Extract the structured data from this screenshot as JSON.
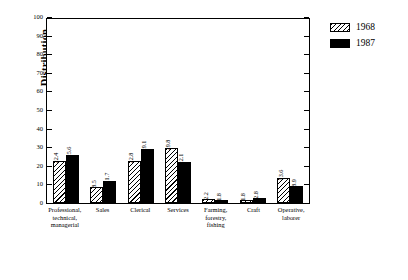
{
  "chart_data": {
    "type": "bar",
    "title": "",
    "xlabel": "",
    "ylabel": "Distribution",
    "ylim": [
      0,
      100
    ],
    "yticks": [
      0,
      10,
      20,
      30,
      40,
      50,
      60,
      70,
      80,
      90,
      100
    ],
    "grid": false,
    "legend_position": "right",
    "categories": [
      "Professional, technical, managerial",
      "Sales",
      "Clerical",
      "Services",
      "Farming, forestry, fishing",
      "Craft",
      "Operative, laborer"
    ],
    "series": [
      {
        "name": "1968",
        "pattern": "hatch",
        "color": "#000000",
        "values": [
          22.4,
          8.5,
          22.8,
          29.8,
          2.2,
          1.8,
          13.6
        ]
      },
      {
        "name": "1987",
        "pattern": "solid",
        "color": "#000000",
        "values": [
          25.6,
          11.7,
          29.1,
          22.1,
          1.8,
          2.8,
          8.9
        ]
      }
    ]
  },
  "legend": {
    "entries": [
      {
        "label": "1968"
      },
      {
        "label": "1987"
      }
    ]
  }
}
